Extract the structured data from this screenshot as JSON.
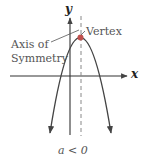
{
  "figure": {
    "axis_labels": {
      "x": "x",
      "y": "y"
    },
    "annotations": {
      "vertex": "Vertex",
      "axis_of_symmetry_line1": "Axis of",
      "axis_of_symmetry_line2": "Symmetry"
    },
    "caption": "a < 0",
    "colors": {
      "curve": "#444444",
      "axes": "#333333",
      "symmetry_line": "#888888",
      "vertex_point": "#c0504d"
    }
  }
}
